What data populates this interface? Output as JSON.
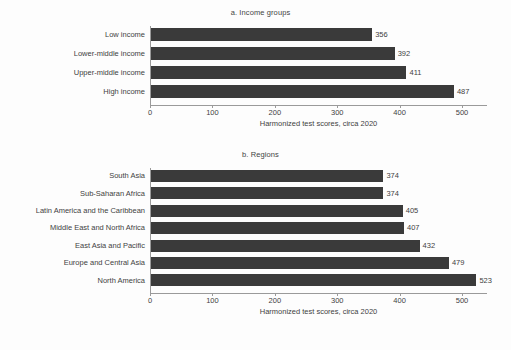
{
  "figure": {
    "background": "#fdfdfd",
    "bar_color": "#3a3a3a",
    "axis_color": "#9a9a9a",
    "text_color": "#3f3f3f"
  },
  "chart_data": [
    {
      "type": "bar",
      "orientation": "horizontal",
      "title": "a. Income groups",
      "categories": [
        "Low income",
        "Lower-middle income",
        "Upper-middle income",
        "High income"
      ],
      "values": [
        356,
        392,
        411,
        487
      ],
      "xlabel": "Harmonized test scores, circa 2020",
      "ylabel": "",
      "xlim": [
        0,
        540
      ],
      "xticks": [
        0,
        100,
        200,
        300,
        400,
        500
      ],
      "xticklabels": [
        "0",
        "100",
        "200",
        "300",
        "400",
        "500"
      ],
      "grid": false,
      "legend": "none",
      "data_labels": [
        "356",
        "392",
        "411",
        "487"
      ]
    },
    {
      "type": "bar",
      "orientation": "horizontal",
      "title": "b. Regions",
      "categories": [
        "South Asia",
        "Sub-Saharan Africa",
        "Latin America and the Caribbean",
        "Middle East and North Africa",
        "East Asia and Pacific",
        "Europe and Central Asia",
        "North America"
      ],
      "values": [
        374,
        374,
        405,
        407,
        432,
        479,
        523
      ],
      "xlabel": "Harmonized test scores, circa 2020",
      "ylabel": "",
      "xlim": [
        0,
        540
      ],
      "xticks": [
        0,
        100,
        200,
        300,
        400,
        500
      ],
      "xticklabels": [
        "0",
        "100",
        "200",
        "300",
        "400",
        "500"
      ],
      "grid": false,
      "legend": "none",
      "data_labels": [
        "374",
        "374",
        "405",
        "407",
        "432",
        "479",
        "523"
      ]
    }
  ]
}
